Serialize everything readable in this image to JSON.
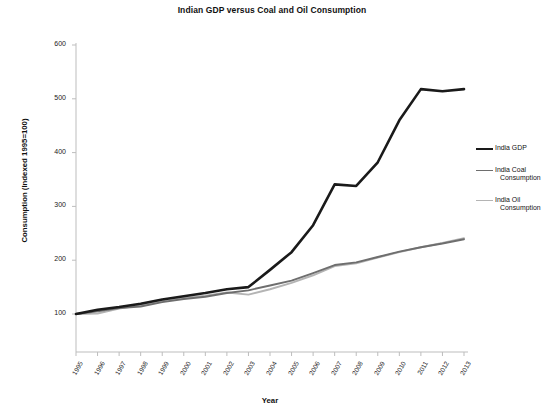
{
  "chart_data": {
    "type": "line",
    "title": "Indian GDP versus Coal and Oil Consumption",
    "xlabel": "Year",
    "ylabel": "Consumption (Indexed 1995=100)",
    "categories": [
      "1995",
      "1996",
      "1997",
      "1998",
      "1999",
      "2000",
      "2001",
      "2002",
      "2003",
      "2004",
      "2005",
      "2006",
      "2007",
      "2008",
      "2009",
      "2010",
      "2011",
      "2012",
      "2013"
    ],
    "ylim": [
      0,
      600
    ],
    "yticks": [
      100,
      200,
      300,
      400,
      500,
      600
    ],
    "grid": false,
    "legend_position": "right",
    "series": [
      {
        "name": "India GDP",
        "label_lines": [
          "India GDP"
        ],
        "color": "#1a1a1a",
        "width": 2.6,
        "values": [
          100,
          108,
          113,
          119,
          127,
          133,
          139,
          146,
          150,
          182,
          215,
          265,
          341,
          338,
          382,
          460,
          518,
          514,
          518
        ]
      },
      {
        "name": "India Coal Consumption",
        "label_lines": [
          "India Coal",
          "Consumption"
        ],
        "color": "#6e6e6e",
        "width": 1.9,
        "values": [
          100,
          105,
          111,
          114,
          122,
          128,
          132,
          139,
          144,
          153,
          162,
          176,
          191,
          196,
          206,
          216,
          224,
          231,
          239
        ]
      },
      {
        "name": "India Oil Consumption",
        "label_lines": [
          "India Oil",
          "Consumption"
        ],
        "color": "#b4b4b4",
        "width": 1.9,
        "values": [
          100,
          101,
          110,
          116,
          124,
          130,
          134,
          140,
          136,
          146,
          158,
          172,
          189,
          194,
          205,
          215,
          224,
          232,
          241
        ]
      }
    ]
  },
  "colors": {
    "axis": "#bdbdbd",
    "text": "#222222",
    "gdp": "#1a1a1a",
    "coal": "#6e6e6e",
    "oil": "#b4b4b4"
  }
}
